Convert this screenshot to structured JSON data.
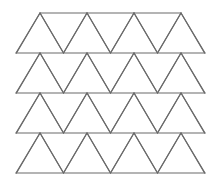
{
  "figure": {
    "title": "Triangle tessellation pattern",
    "background_color": "#ffffff",
    "stroke_color": "#6b6b6b",
    "stroke_width": 1.15,
    "fill": "none",
    "canvas": {
      "width": 220,
      "height": 190
    }
  },
  "chart_data": {
    "type": "diagram",
    "shape": "equilateral-triangle-tessellation",
    "title": "Triangle tessellation pattern",
    "rows": 4,
    "upward_triangles_per_row": 4,
    "downward_triangles_per_row": 3,
    "half_triangles_per_row": 2,
    "total_full_triangles": 28,
    "geometry": {
      "left_edge_x": 16,
      "right_edge_x": 205,
      "row_baselines_y": [
        53,
        93,
        133,
        173
      ],
      "row_tops_y": [
        13,
        53,
        93,
        133
      ],
      "row_height": 40,
      "apex_spacing_x": 47,
      "half_span_x": 23.5,
      "upward_apex_x": [
        40,
        87,
        134,
        181
      ],
      "downward_apex_x": [
        63.5,
        110.5,
        157.5
      ]
    },
    "rows_detail": [
      {
        "index": 1,
        "baseline_y": 53,
        "top_y": 13,
        "upward_apexes_x": [
          40,
          87,
          134,
          181
        ],
        "downward_apexes_x": [
          63.5,
          110.5,
          157.5
        ]
      },
      {
        "index": 2,
        "baseline_y": 93,
        "top_y": 53,
        "upward_apexes_x": [
          40,
          87,
          134,
          181
        ],
        "downward_apexes_x": [
          63.5,
          110.5,
          157.5
        ]
      },
      {
        "index": 3,
        "baseline_y": 133,
        "top_y": 93,
        "upward_apexes_x": [
          40,
          87,
          134,
          181
        ],
        "downward_apexes_x": [
          63.5,
          110.5,
          157.5
        ]
      },
      {
        "index": 4,
        "baseline_y": 173,
        "top_y": 133,
        "upward_apexes_x": [
          40,
          87,
          134,
          181
        ],
        "downward_apexes_x": [
          63.5,
          110.5,
          157.5
        ]
      }
    ],
    "grid": false,
    "legend": null,
    "xlabel": "",
    "ylabel": ""
  }
}
